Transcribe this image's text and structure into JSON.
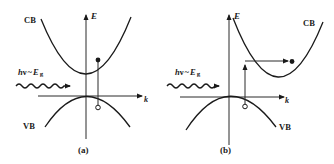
{
  "figure": {
    "panels": [
      {
        "id": "a",
        "caption": "(a)",
        "type": "direct-gap",
        "axes": {
          "y_label": "E",
          "x_label": "k"
        },
        "bands": {
          "conduction": "CB",
          "valence": "VB"
        },
        "photon_label": {
          "h": "h",
          "nu": "ν",
          "tilde": "~",
          "E": "E",
          "sub": "g"
        },
        "transition": "vertical"
      },
      {
        "id": "b",
        "caption": "(b)",
        "type": "indirect-gap",
        "axes": {
          "y_label": "E",
          "x_label": "k"
        },
        "bands": {
          "conduction": "CB",
          "valence": "VB"
        },
        "photon_label": {
          "h": "h",
          "nu": "ν",
          "tilde": "~",
          "E": "E",
          "sub": "g"
        },
        "transition": "vertical-then-horizontal"
      }
    ],
    "colors": {
      "ink": "#1a1a1a",
      "background": "#ffffff"
    }
  }
}
